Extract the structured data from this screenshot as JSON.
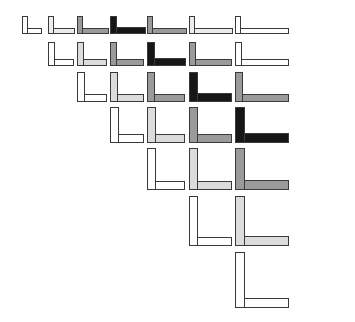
{
  "figure": {
    "type": "stimulus-array",
    "width": 355,
    "height": 322,
    "background": "#ffffff",
    "stroke_color": "#3a3a3a",
    "stroke_width": 1,
    "row_count": 7
  },
  "palette": {
    "white": "#ffffff",
    "very_light_gray": "#ececec",
    "light_gray": "#dcdcdc",
    "medium_gray": "#9a9a9a",
    "dark_gray": "#6e6e6e",
    "black": "#161616",
    "outline": "#3a3a3a"
  },
  "grid": {
    "column_x": [
      22,
      48,
      77,
      110,
      147,
      189,
      235
    ],
    "row_y": [
      16,
      42,
      72,
      107,
      148,
      196,
      252
    ],
    "column_labels": [
      "c1",
      "c2",
      "c3",
      "c4",
      "c5",
      "c6",
      "c7"
    ],
    "row_labels": [
      "r1",
      "r2",
      "r3",
      "r4",
      "r5",
      "r6",
      "r7"
    ]
  },
  "rows": [
    {
      "index": 1,
      "label": "r1",
      "start_column": 0,
      "count": 7,
      "glyph": {
        "width": 20,
        "height": 18,
        "bar": 6
      },
      "shapes": [
        {
          "id": "r1c1",
          "column": 1,
          "x": 22,
          "y": 16,
          "w": 20,
          "h": 18,
          "bar": 6,
          "fill": "#ffffff",
          "tone": "white"
        },
        {
          "id": "r1c2",
          "column": 2,
          "x": 48,
          "y": 16,
          "w": 27,
          "h": 18,
          "bar": 6,
          "fill": "#ececec",
          "tone": "very_light_gray"
        },
        {
          "id": "r1c3",
          "column": 3,
          "x": 77,
          "y": 16,
          "w": 32,
          "h": 18,
          "bar": 6,
          "fill": "#9a9a9a",
          "tone": "medium_gray"
        },
        {
          "id": "r1c4",
          "column": 4,
          "x": 110,
          "y": 16,
          "w": 36,
          "h": 18,
          "bar": 7,
          "fill": "#161616",
          "tone": "black"
        },
        {
          "id": "r1c5",
          "column": 5,
          "x": 147,
          "y": 16,
          "w": 40,
          "h": 18,
          "bar": 6,
          "fill": "#9a9a9a",
          "tone": "medium_gray"
        },
        {
          "id": "r1c6",
          "column": 6,
          "x": 189,
          "y": 16,
          "w": 44,
          "h": 18,
          "bar": 6,
          "fill": "#ececec",
          "tone": "very_light_gray"
        },
        {
          "id": "r1c7",
          "column": 7,
          "x": 235,
          "y": 16,
          "w": 54,
          "h": 18,
          "bar": 6,
          "fill": "#ffffff",
          "tone": "white"
        }
      ]
    },
    {
      "index": 2,
      "label": "r2",
      "start_column": 1,
      "count": 6,
      "glyph": {
        "width": 27,
        "height": 24,
        "bar": 7
      },
      "shapes": [
        {
          "id": "r2c2",
          "column": 2,
          "x": 48,
          "y": 42,
          "w": 26,
          "h": 24,
          "bar": 7,
          "fill": "#ffffff",
          "tone": "white"
        },
        {
          "id": "r2c3",
          "column": 3,
          "x": 77,
          "y": 42,
          "w": 30,
          "h": 24,
          "bar": 7,
          "fill": "#dcdcdc",
          "tone": "light_gray"
        },
        {
          "id": "r2c4",
          "column": 4,
          "x": 110,
          "y": 42,
          "w": 34,
          "h": 24,
          "bar": 7,
          "fill": "#9a9a9a",
          "tone": "medium_gray"
        },
        {
          "id": "r2c5",
          "column": 5,
          "x": 147,
          "y": 42,
          "w": 39,
          "h": 24,
          "bar": 8,
          "fill": "#161616",
          "tone": "black"
        },
        {
          "id": "r2c6",
          "column": 6,
          "x": 189,
          "y": 42,
          "w": 43,
          "h": 24,
          "bar": 7,
          "fill": "#9a9a9a",
          "tone": "medium_gray"
        },
        {
          "id": "r2c7",
          "column": 7,
          "x": 235,
          "y": 42,
          "w": 54,
          "h": 24,
          "bar": 7,
          "fill": "#ffffff",
          "tone": "white"
        }
      ]
    },
    {
      "index": 3,
      "label": "r3",
      "start_column": 2,
      "count": 5,
      "glyph": {
        "width": 32,
        "height": 30,
        "bar": 8
      },
      "shapes": [
        {
          "id": "r3c3",
          "column": 3,
          "x": 77,
          "y": 72,
          "w": 30,
          "h": 30,
          "bar": 8,
          "fill": "#ffffff",
          "tone": "white"
        },
        {
          "id": "r3c4",
          "column": 4,
          "x": 110,
          "y": 72,
          "w": 34,
          "h": 30,
          "bar": 8,
          "fill": "#dcdcdc",
          "tone": "light_gray"
        },
        {
          "id": "r3c5",
          "column": 5,
          "x": 147,
          "y": 72,
          "w": 38,
          "h": 30,
          "bar": 8,
          "fill": "#9a9a9a",
          "tone": "medium_gray"
        },
        {
          "id": "r3c6",
          "column": 6,
          "x": 189,
          "y": 72,
          "w": 43,
          "h": 30,
          "bar": 9,
          "fill": "#161616",
          "tone": "black"
        },
        {
          "id": "r3c7",
          "column": 7,
          "x": 235,
          "y": 72,
          "w": 54,
          "h": 30,
          "bar": 8,
          "fill": "#9a9a9a",
          "tone": "medium_gray"
        }
      ]
    },
    {
      "index": 4,
      "label": "r4",
      "start_column": 3,
      "count": 4,
      "glyph": {
        "width": 36,
        "height": 36,
        "bar": 9
      },
      "shapes": [
        {
          "id": "r4c4",
          "column": 4,
          "x": 110,
          "y": 107,
          "w": 34,
          "h": 36,
          "bar": 9,
          "fill": "#ffffff",
          "tone": "white"
        },
        {
          "id": "r4c5",
          "column": 5,
          "x": 147,
          "y": 107,
          "w": 38,
          "h": 36,
          "bar": 9,
          "fill": "#dcdcdc",
          "tone": "light_gray"
        },
        {
          "id": "r4c6",
          "column": 6,
          "x": 189,
          "y": 107,
          "w": 43,
          "h": 36,
          "bar": 9,
          "fill": "#9a9a9a",
          "tone": "medium_gray"
        },
        {
          "id": "r4c7",
          "column": 7,
          "x": 235,
          "y": 107,
          "w": 54,
          "h": 36,
          "bar": 10,
          "fill": "#161616",
          "tone": "black"
        }
      ]
    },
    {
      "index": 5,
      "label": "r5",
      "start_column": 4,
      "count": 3,
      "glyph": {
        "width": 40,
        "height": 42,
        "bar": 9
      },
      "shapes": [
        {
          "id": "r5c5",
          "column": 5,
          "x": 147,
          "y": 148,
          "w": 38,
          "h": 42,
          "bar": 9,
          "fill": "#ffffff",
          "tone": "white"
        },
        {
          "id": "r5c6",
          "column": 6,
          "x": 189,
          "y": 148,
          "w": 43,
          "h": 42,
          "bar": 9,
          "fill": "#dcdcdc",
          "tone": "light_gray"
        },
        {
          "id": "r5c7",
          "column": 7,
          "x": 235,
          "y": 148,
          "w": 54,
          "h": 42,
          "bar": 10,
          "fill": "#9a9a9a",
          "tone": "medium_gray"
        }
      ]
    },
    {
      "index": 6,
      "label": "r6",
      "start_column": 5,
      "count": 2,
      "glyph": {
        "width": 44,
        "height": 50,
        "bar": 9
      },
      "shapes": [
        {
          "id": "r6c6",
          "column": 6,
          "x": 189,
          "y": 196,
          "w": 43,
          "h": 50,
          "bar": 9,
          "fill": "#ffffff",
          "tone": "white"
        },
        {
          "id": "r6c7",
          "column": 7,
          "x": 235,
          "y": 196,
          "w": 54,
          "h": 50,
          "bar": 10,
          "fill": "#dcdcdc",
          "tone": "light_gray"
        }
      ]
    },
    {
      "index": 7,
      "label": "r7",
      "start_column": 6,
      "count": 1,
      "glyph": {
        "width": 54,
        "height": 56,
        "bar": 10
      },
      "shapes": [
        {
          "id": "r7c7",
          "column": 7,
          "x": 235,
          "y": 252,
          "w": 54,
          "h": 56,
          "bar": 10,
          "fill": "#ffffff",
          "tone": "white"
        }
      ]
    }
  ]
}
